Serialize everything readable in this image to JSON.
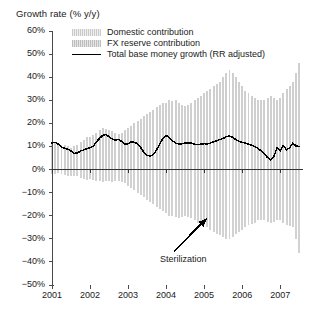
{
  "chart_data": {
    "type": "bar",
    "title": "Growth rate (% y/y)",
    "xlabel": "",
    "ylabel": "Growth rate (% y/y)",
    "ylim": [
      -50,
      60
    ],
    "xlim": [
      2001.0,
      2007.6
    ],
    "grid": false,
    "legend_position": "top-left-inside",
    "ytick_labels": [
      "60%",
      "50%",
      "40%",
      "30%",
      "20%",
      "10%",
      "0%",
      "−10%",
      "−20%",
      "−30%",
      "−40%",
      "−50%"
    ],
    "ytick_values": [
      60,
      50,
      40,
      30,
      20,
      10,
      0,
      -10,
      -20,
      -30,
      -40,
      -50
    ],
    "xtick_labels": [
      "2001",
      "2002",
      "2003",
      "2004",
      "2005",
      "2006",
      "2007"
    ],
    "xtick_values": [
      2001,
      2002,
      2003,
      2004,
      2005,
      2006,
      2007
    ],
    "annotations": [
      {
        "text": "Sterilization",
        "x": 2004.05,
        "y": -39,
        "arrow_to_x": 2004.45,
        "arrow_to_y": -21
      }
    ],
    "colors": {
      "domestic_bar": "#d2d2d2",
      "fx_bar": "#cfcfcf",
      "total_line": "#000000",
      "axis": "#4a4a4a",
      "background": "#ffffff"
    },
    "x": [
      2001.0,
      2001.083,
      2001.167,
      2001.25,
      2001.333,
      2001.417,
      2001.5,
      2001.583,
      2001.667,
      2001.75,
      2001.833,
      2001.917,
      2002.0,
      2002.083,
      2002.167,
      2002.25,
      2002.333,
      2002.417,
      2002.5,
      2002.583,
      2002.667,
      2002.75,
      2002.833,
      2002.917,
      2003.0,
      2003.083,
      2003.167,
      2003.25,
      2003.333,
      2003.417,
      2003.5,
      2003.583,
      2003.667,
      2003.75,
      2003.833,
      2003.917,
      2004.0,
      2004.083,
      2004.167,
      2004.25,
      2004.333,
      2004.417,
      2004.5,
      2004.583,
      2004.667,
      2004.75,
      2004.833,
      2004.917,
      2005.0,
      2005.083,
      2005.167,
      2005.25,
      2005.333,
      2005.417,
      2005.5,
      2005.583,
      2005.667,
      2005.75,
      2005.833,
      2005.917,
      2006.0,
      2006.083,
      2006.167,
      2006.25,
      2006.333,
      2006.417,
      2006.5,
      2006.583,
      2006.667,
      2006.75,
      2006.833,
      2006.917,
      2007.0,
      2007.083,
      2007.167,
      2007.25,
      2007.333,
      2007.417,
      2007.5
    ],
    "series": [
      {
        "name": "FX reserve contribution",
        "type": "bar",
        "values": [
          12,
          11.5,
          11,
          10.5,
          10.5,
          10,
          9.5,
          10,
          10.5,
          12,
          13,
          14,
          14,
          15,
          16,
          17,
          18,
          17.5,
          17,
          16.5,
          16,
          15.5,
          16,
          17,
          18,
          19,
          20,
          21,
          22,
          23,
          24,
          25,
          26,
          27,
          28,
          29,
          29,
          30,
          29.5,
          30,
          29,
          28,
          27.5,
          28,
          29,
          30,
          31,
          32,
          33,
          34,
          35,
          36,
          37,
          38,
          40,
          42,
          43,
          42,
          40,
          38,
          36,
          34,
          33,
          32,
          31,
          30,
          30,
          30,
          31,
          32,
          31,
          30,
          31,
          33,
          35,
          36,
          38,
          42,
          46
        ]
      },
      {
        "name": "Domestic contribution",
        "type": "bar",
        "values": [
          -2,
          -2,
          -1.5,
          -2,
          -2.5,
          -3,
          -3,
          -3,
          -3,
          -3.5,
          -4,
          -4.5,
          -4,
          -4.5,
          -5,
          -5,
          -5.5,
          -5,
          -5,
          -5.5,
          -5,
          -5,
          -5.5,
          -6,
          -7,
          -8,
          -9,
          -10,
          -11,
          -12,
          -13,
          -14,
          -15,
          -16,
          -17,
          -18,
          -19,
          -20,
          -20,
          -20.5,
          -21,
          -20.5,
          -20,
          -20.5,
          -21,
          -22,
          -23,
          -24,
          -24,
          -25,
          -26,
          -27,
          -28,
          -28.5,
          -29,
          -30,
          -30,
          -29,
          -28,
          -27,
          -26,
          -25,
          -24,
          -23.5,
          -23,
          -22,
          -22,
          -22,
          -22.5,
          -23,
          -22.5,
          -22,
          -22,
          -23,
          -24,
          -24.5,
          -25,
          -30,
          -36
        ]
      },
      {
        "name": "Total base money growth (RR adjusted)",
        "type": "line",
        "values": [
          11.5,
          11.8,
          11.0,
          9.8,
          9.2,
          8.8,
          8.0,
          7.0,
          7.2,
          8.0,
          8.5,
          9.0,
          9.5,
          10.0,
          12.0,
          13.5,
          14.8,
          15.2,
          14.2,
          13.2,
          12.8,
          13.0,
          12.2,
          11.0,
          11.2,
          12.0,
          11.8,
          11.2,
          9.5,
          7.5,
          6.2,
          5.8,
          6.5,
          8.5,
          11.0,
          13.5,
          14.8,
          13.8,
          12.5,
          11.5,
          11.0,
          11.2,
          11.5,
          11.6,
          11.4,
          11.0,
          10.8,
          11.0,
          11.2,
          11.0,
          11.5,
          12.0,
          12.5,
          13.0,
          13.5,
          14.2,
          14.5,
          14.0,
          13.0,
          12.2,
          11.8,
          11.5,
          11.0,
          10.5,
          10.0,
          9.2,
          8.0,
          6.8,
          5.2,
          4.2,
          5.5,
          9.5,
          8.0,
          10.5,
          8.5,
          9.5,
          11.5,
          10.2,
          10.0
        ]
      }
    ]
  },
  "legend": {
    "items": [
      {
        "label": "Domestic contribution",
        "swatch": "bar-light-gray"
      },
      {
        "label": "FX reserve contribution",
        "swatch": "bar-gray"
      },
      {
        "label": "Total base money growth (RR adjusted)",
        "swatch": "line-black"
      }
    ]
  },
  "annotation": {
    "sterilization_label": "Sterilization",
    "arrow_icon": "arrow-up-right-icon"
  }
}
